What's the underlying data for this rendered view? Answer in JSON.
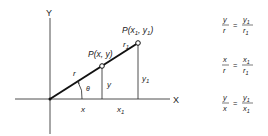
{
  "diagram": {
    "axis_x_label": "X",
    "axis_y_label": "Y",
    "point_p": "P(x, y)",
    "point_p1_base": "P(x",
    "point_p1_sub1": "1",
    "point_p1_mid": ", y",
    "point_p1_sub2": "1",
    "point_p1_end": ")",
    "label_r": "r",
    "label_r1": "r",
    "label_r1_sub": "1",
    "label_theta": "θ",
    "label_y": "y",
    "label_y1": "y",
    "label_y1_sub": "1",
    "label_x": "x",
    "label_x1": "x",
    "label_x1_sub": "1"
  },
  "equations": [
    {
      "lhs_num": "y",
      "lhs_den": "r",
      "rhs_num": "y",
      "rhs_num_sub": "1",
      "rhs_den": "r",
      "rhs_den_sub": "1"
    },
    {
      "lhs_num": "x",
      "lhs_den": "r",
      "rhs_num": "x",
      "rhs_num_sub": "1",
      "rhs_den": "r",
      "rhs_den_sub": "1"
    },
    {
      "lhs_num": "y",
      "lhs_den": "x",
      "rhs_num": "y",
      "rhs_num_sub": "1",
      "rhs_den": "x",
      "rhs_den_sub": "1"
    }
  ],
  "equals": "="
}
